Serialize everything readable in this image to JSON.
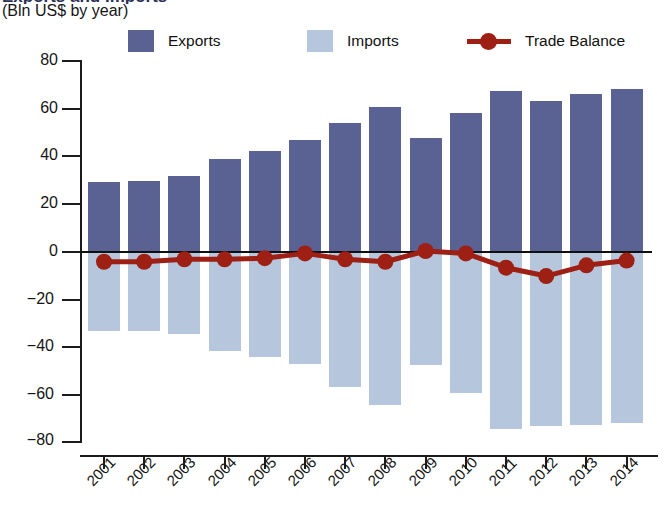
{
  "header": {
    "title_partial": "Exports and Imports",
    "subtitle": "(Bln US$ by year)"
  },
  "legend": {
    "items": [
      {
        "label": "Exports",
        "color": "#5a6294",
        "kind": "swatch"
      },
      {
        "label": "Imports",
        "color": "#b6c6dc",
        "kind": "swatch"
      },
      {
        "label": "Trade Balance",
        "color": "#9e1f14",
        "kind": "line-marker"
      }
    ]
  },
  "axis": {
    "y_ticks": [
      "80",
      "60",
      "40",
      "20",
      "0",
      "−20",
      "−40",
      "−60",
      "−80"
    ],
    "x_ticks": [
      "2001",
      "2002",
      "2003",
      "2004",
      "2005",
      "2006",
      "2007",
      "2008",
      "2009",
      "2010",
      "2011",
      "2012",
      "2013",
      "2014"
    ]
  },
  "colors": {
    "exports": "#5a6294",
    "imports": "#b6c6dc",
    "trade_balance": "#9e1f14",
    "axis": "#1b1b1b",
    "title": "#2a2f55"
  },
  "chart_data": {
    "type": "bar",
    "title": "Exports and Imports",
    "subtitle": "(Bln US$ by year)",
    "xlabel": "",
    "ylabel": "Bln US$",
    "ylim": [
      -80,
      80
    ],
    "ytick_step": 20,
    "grid": false,
    "legend_position": "top",
    "categories": [
      "2001",
      "2002",
      "2003",
      "2004",
      "2005",
      "2006",
      "2007",
      "2008",
      "2009",
      "2010",
      "2011",
      "2012",
      "2013",
      "2014"
    ],
    "series": [
      {
        "name": "Exports",
        "type": "bar",
        "color": "#5a6294",
        "values": [
          29,
          29.5,
          31.5,
          38.5,
          42,
          46.5,
          53.5,
          60.5,
          47.5,
          58,
          67,
          63,
          66,
          68
        ]
      },
      {
        "name": "Imports",
        "type": "bar",
        "color": "#b6c6dc",
        "values": [
          -33.5,
          -33.5,
          -35,
          -42,
          -44.5,
          -47.5,
          -57,
          -64.5,
          -48,
          -59.5,
          -74.5,
          -73.5,
          -73,
          -72
        ]
      },
      {
        "name": "Trade Balance",
        "type": "line",
        "color": "#9e1f14",
        "values": [
          -4.5,
          -4.5,
          -3.5,
          -3.5,
          -3,
          -1,
          -3.5,
          -4.5,
          0,
          -1,
          -7,
          -10.5,
          -6,
          -4
        ]
      }
    ]
  }
}
